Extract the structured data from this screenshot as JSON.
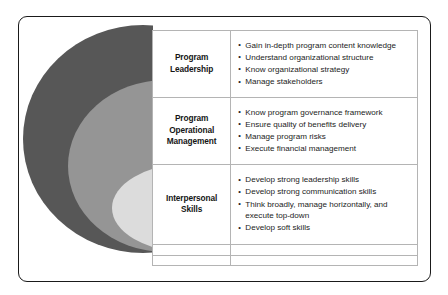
{
  "figure": {
    "type": "concentric-ellipse-matrix",
    "frame": {
      "border_color": "#1a1a1a",
      "background": "#ffffff"
    },
    "venn": {
      "ellipses": [
        {
          "name": "outer-ellipse",
          "color": "#575757",
          "maps_to_row": 0
        },
        {
          "name": "middle-ellipse",
          "color": "#959595",
          "maps_to_row": 1
        },
        {
          "name": "inner-ellipse",
          "color": "#dcdcdc",
          "maps_to_row": 2
        }
      ]
    },
    "table": {
      "border_color": "#b4b4b4",
      "rows": [
        {
          "label": "Program\nLeadership",
          "label_line1": "Program",
          "label_line2": "Leadership",
          "items": [
            "Gain in-depth program content knowledge",
            "Understand organizational structure",
            "Know organizational strategy",
            "Manage stakeholders"
          ]
        },
        {
          "label": "Program Operational Management",
          "label_line1": "Program",
          "label_line2": "Operational",
          "label_line3": "Management",
          "items": [
            "Know program governance framework",
            "Ensure quality of benefits delivery",
            "Manage program risks",
            "Execute financial management"
          ]
        },
        {
          "label": "Interpersonal Skills",
          "label_line1": "Interpersonal",
          "label_line2": "Skills",
          "items": [
            "Develop strong leadership skills",
            "Develop strong communication skills",
            "Think broadly, manage horizontally, and execute top-down",
            "Develop soft skills"
          ]
        }
      ],
      "blank_rows": 2
    }
  }
}
